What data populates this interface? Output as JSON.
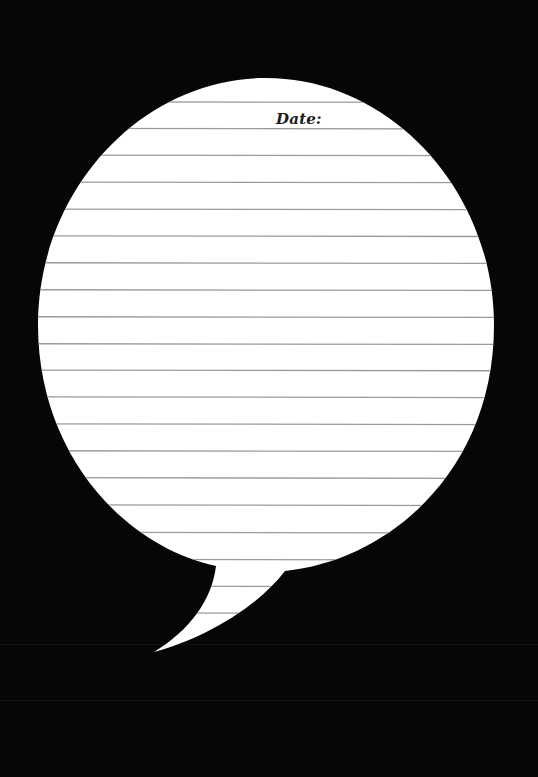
{
  "worksheet": {
    "date_label": "Date:",
    "shape": "speech-bubble",
    "ruled_line_count": 20
  },
  "colors": {
    "background": "#060606",
    "bubble_fill": "#ffffff",
    "rule_line": "#9a9a9a",
    "text": "#1c1c1c"
  }
}
